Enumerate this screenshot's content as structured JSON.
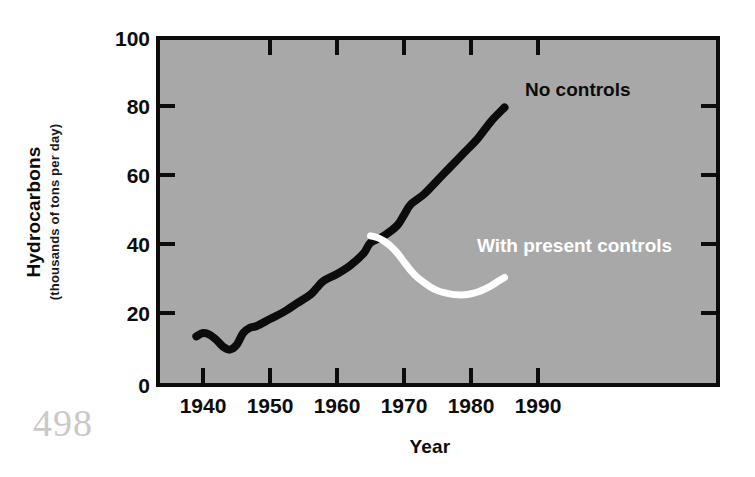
{
  "page": {
    "number": "498",
    "background_color": "#ffffff"
  },
  "chart_data": {
    "type": "line",
    "title": "",
    "xlabel": "Year",
    "ylabel": "Hydrocarbons",
    "ylabel_sub": "(thousands of tons per day)",
    "plot_background_color": "#a8a8a8",
    "axis_color": "#0c0c0c",
    "grid": false,
    "legend_position": "inline-annotations",
    "xlim": [
      1935,
      1993
    ],
    "ylim": [
      0,
      100
    ],
    "xticks": [
      "1940",
      "1950",
      "1960",
      "1970",
      "1980",
      "1990"
    ],
    "xtick_values": [
      1940,
      1950,
      1960,
      1970,
      1980,
      1990
    ],
    "yticks": [
      "0",
      "20",
      "40",
      "60",
      "80",
      "100"
    ],
    "ytick_values": [
      0,
      20,
      40,
      60,
      80,
      100
    ],
    "series": [
      {
        "name": "No controls",
        "color": "#0c0c0c",
        "label_x": 1977.5,
        "label_y": 88,
        "x": [
          1939,
          1940,
          1941,
          1942,
          1943,
          1944,
          1945,
          1946,
          1947,
          1948,
          1950,
          1952,
          1954,
          1956,
          1957,
          1958,
          1960,
          1962,
          1964,
          1965,
          1967,
          1969,
          1970,
          1971,
          1973,
          1975,
          1977,
          1979,
          1981,
          1983,
          1985
        ],
        "values": [
          14,
          15,
          14.5,
          13,
          11,
          10.2,
          11.5,
          15,
          16.5,
          17,
          19,
          21,
          23.5,
          26,
          28,
          30,
          32,
          34.5,
          38,
          41,
          43,
          46,
          49,
          52,
          55,
          59,
          63,
          67,
          71,
          76,
          80
        ]
      },
      {
        "name": "With present controls",
        "color": "#ffffff",
        "label_x": 1974.5,
        "label_y": 39,
        "x": [
          1965,
          1966,
          1967,
          1968,
          1969,
          1970,
          1971,
          1972,
          1973,
          1974,
          1975,
          1976,
          1977,
          1978,
          1979,
          1980,
          1981,
          1982,
          1983,
          1984,
          1985
        ],
        "values": [
          43,
          42.5,
          41.5,
          40,
          38,
          35.5,
          33,
          31,
          29.5,
          28.2,
          27.2,
          26.6,
          26.2,
          26.0,
          26.0,
          26.3,
          26.8,
          27.6,
          28.6,
          29.8,
          31
        ]
      }
    ],
    "annotations": [
      {
        "text": "No controls",
        "color": "#0c0c0c"
      },
      {
        "text": "With present controls",
        "color": "#ffffff"
      }
    ]
  }
}
